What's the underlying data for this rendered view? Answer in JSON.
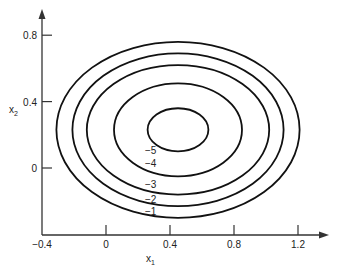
{
  "chart_data": {
    "type": "contour",
    "title": "",
    "xlabel": "x1",
    "ylabel": "x2",
    "xlim": [
      -0.4,
      1.4
    ],
    "ylim": [
      -0.4,
      0.95
    ],
    "grid": false,
    "x_ticks": [
      {
        "value": -0.4,
        "label": "−0.4"
      },
      {
        "value": 0,
        "label": "0"
      },
      {
        "value": 0.4,
        "label": "0.4"
      },
      {
        "value": 0.8,
        "label": "0.8"
      },
      {
        "value": 1.2,
        "label": "1.2"
      }
    ],
    "y_ticks": [
      {
        "value": 0,
        "label": "0"
      },
      {
        "value": 0.4,
        "label": "0.4"
      },
      {
        "value": 0.8,
        "label": "0.8"
      }
    ],
    "center": {
      "x1": 0.45,
      "x2": 0.23
    },
    "contours": [
      {
        "level": -5,
        "label": "−5",
        "semi_axis_x1": 0.19,
        "semi_axis_x2": 0.13
      },
      {
        "level": -4,
        "label": "−4",
        "semi_axis_x1": 0.4,
        "semi_axis_x2": 0.28
      },
      {
        "level": -3,
        "label": "−3",
        "semi_axis_x1": 0.57,
        "semi_axis_x2": 0.39
      },
      {
        "level": -2,
        "label": "−2",
        "semi_axis_x1": 0.66,
        "semi_axis_x2": 0.46
      },
      {
        "level": -1,
        "label": "−1",
        "semi_axis_x1": 0.76,
        "semi_axis_x2": 0.53
      }
    ],
    "line_color": "#111111"
  }
}
